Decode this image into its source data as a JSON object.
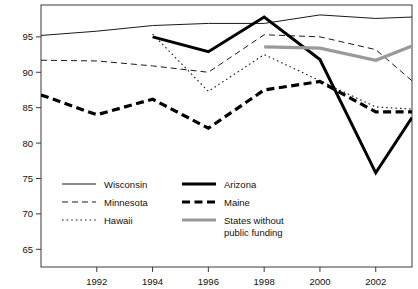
{
  "chart_data": {
    "type": "line",
    "title": "",
    "xlabel": "",
    "ylabel": "",
    "xlim": [
      1990,
      2003.3
    ],
    "ylim": [
      62.5,
      99.5
    ],
    "grid": false,
    "legend_position": "inside-bottom-left",
    "xticks": [
      1992,
      1994,
      1996,
      1998,
      2000,
      2002
    ],
    "yticks": [
      65,
      70,
      75,
      80,
      85,
      90,
      95
    ],
    "xtick_labels": [
      "1992",
      "1994",
      "1996",
      "1998",
      "2000",
      "2002"
    ],
    "ytick_labels": [
      "65",
      "70",
      "75",
      "80",
      "85",
      "90",
      "95"
    ],
    "series": [
      {
        "name": "Wisconsin",
        "style": "solid-thin",
        "color": "#1a1a1a",
        "x": [
          1990,
          1992,
          1994,
          1996,
          1998,
          2000,
          2002,
          2003.3
        ],
        "values": [
          95.2,
          95.8,
          96.6,
          96.9,
          96.9,
          98.1,
          97.6,
          97.8
        ]
      },
      {
        "name": "Minnesota",
        "style": "dashed-thin",
        "color": "#1a1a1a",
        "x": [
          1990,
          1992,
          1994,
          1996,
          1998,
          2000,
          2002,
          2003.3
        ],
        "values": [
          91.7,
          91.6,
          90.9,
          90.0,
          95.3,
          95.0,
          93.2,
          88.8
        ]
      },
      {
        "name": "Hawaii",
        "style": "dotted-thin",
        "color": "#1a1a1a",
        "x": [
          1990,
          1992,
          1994,
          1996,
          1998,
          2000,
          2002,
          2003.3
        ],
        "values": [
          null,
          null,
          95.4,
          87.3,
          92.5,
          88.8,
          85.1,
          84.8
        ]
      },
      {
        "name": "Arizona",
        "style": "solid-thick",
        "color": "#000000",
        "x": [
          1994,
          1996,
          1998,
          2000,
          2002,
          2003.3
        ],
        "values": [
          95.0,
          92.9,
          97.8,
          91.8,
          75.8,
          83.6
        ]
      },
      {
        "name": "Maine",
        "style": "dashed-thick",
        "color": "#000000",
        "x": [
          1990,
          1992,
          1994,
          1996,
          1998,
          2000,
          2002,
          2003.3
        ],
        "values": [
          86.8,
          84.0,
          86.2,
          82.1,
          87.5,
          88.7,
          84.4,
          84.4
        ]
      },
      {
        "name": "States without public funding",
        "style": "solid-thick-gray",
        "color": "#9a9a9a",
        "x": [
          1998,
          2000,
          2002,
          2003.3
        ],
        "values": [
          93.6,
          93.4,
          91.7,
          93.7
        ]
      }
    ]
  },
  "legend": {
    "items": [
      {
        "label": "Wisconsin",
        "key": "wisconsin"
      },
      {
        "label": "Minnesota",
        "key": "minnesota"
      },
      {
        "label": "Hawaii",
        "key": "hawaii"
      },
      {
        "label": "Arizona",
        "key": "arizona"
      },
      {
        "label": "Maine",
        "key": "maine"
      },
      {
        "label": "States without",
        "label2": "public funding",
        "key": "states-without-public-funding"
      }
    ]
  }
}
